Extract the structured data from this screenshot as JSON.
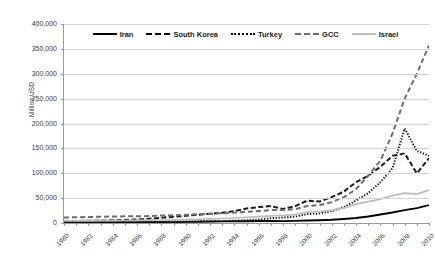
{
  "chart_data": {
    "type": "line",
    "title": "",
    "xlabel": "",
    "ylabel": "Million USD",
    "ylim": [
      0,
      400000
    ],
    "ytick_labels": [
      "400,000",
      "350,000",
      "300,000",
      "250,000",
      "200,000",
      "150,000",
      "100,000",
      "50,000",
      "0"
    ],
    "ytick_values": [
      400000,
      350000,
      300000,
      250000,
      200000,
      150000,
      100000,
      50000,
      0
    ],
    "grid": true,
    "legend_position": "top-inside",
    "x": [
      1980,
      1981,
      1982,
      1983,
      1984,
      1985,
      1986,
      1987,
      1988,
      1989,
      1990,
      1991,
      1992,
      1993,
      1994,
      1995,
      1996,
      1997,
      1998,
      1999,
      2000,
      2001,
      2002,
      2003,
      2004,
      2005,
      2006,
      2007,
      2008,
      2009,
      2010
    ],
    "xtick_labels": [
      "1980",
      "1982",
      "1984",
      "1986",
      "1988",
      "1990",
      "1992",
      "1994",
      "1996",
      "1998",
      "2000",
      "2002",
      "2004",
      "2006",
      "2008",
      "2010"
    ],
    "xlim": [
      1980,
      2010
    ],
    "series": [
      {
        "name": "Iran",
        "style": "solid",
        "color": "#000000",
        "values": [
          1800,
          1500,
          1400,
          1600,
          1500,
          1600,
          1400,
          1500,
          1600,
          1800,
          2200,
          2600,
          3000,
          3200,
          3400,
          3600,
          4000,
          4200,
          3800,
          4200,
          5000,
          5600,
          6500,
          8000,
          10000,
          13000,
          17000,
          21000,
          26000,
          30000,
          36000
        ]
      },
      {
        "name": "South Korea",
        "style": "dashed",
        "color": "#1a1a1a",
        "values": [
          3500,
          4000,
          4500,
          5000,
          5500,
          6000,
          7000,
          8500,
          10500,
          12500,
          14500,
          16500,
          18500,
          20500,
          24000,
          29000,
          32000,
          34000,
          28000,
          34000,
          45000,
          43000,
          52000,
          63000,
          82000,
          95000,
          113000,
          135000,
          140000,
          100000,
          130000
        ]
      },
      {
        "name": "Turkey",
        "style": "dotted",
        "color": "#151515",
        "values": [
          2000,
          2000,
          2100,
          2200,
          2300,
          2400,
          2500,
          2600,
          2700,
          2900,
          3100,
          3300,
          3600,
          4000,
          4500,
          5500,
          7000,
          9500,
          11000,
          13000,
          18000,
          19000,
          24000,
          32000,
          45000,
          60000,
          82000,
          110000,
          190000,
          145000,
          135000
        ]
      },
      {
        "name": "GCC",
        "style": "longdash",
        "color": "#6e6e6e",
        "values": [
          11000,
          11500,
          12000,
          12500,
          13000,
          13500,
          13500,
          14000,
          15000,
          15500,
          16500,
          17500,
          18500,
          19500,
          21000,
          22500,
          24000,
          26000,
          26000,
          28000,
          34000,
          36000,
          42000,
          52000,
          68000,
          95000,
          125000,
          180000,
          250000,
          300000,
          357000
        ]
      },
      {
        "name": "Israel",
        "style": "solid-gray",
        "color": "#bdbdbd",
        "values": [
          4000,
          4200,
          4400,
          4600,
          4800,
          5000,
          5200,
          5600,
          6000,
          6500,
          7000,
          7500,
          8200,
          9000,
          10000,
          11500,
          13000,
          14500,
          15500,
          17000,
          22000,
          23000,
          26000,
          30000,
          38000,
          43000,
          48000,
          55000,
          60000,
          58000,
          66000
        ]
      }
    ],
    "legend": [
      {
        "label": "Iran",
        "style": "solid",
        "color": "#000000"
      },
      {
        "label": "South Korea",
        "style": "dashed",
        "color": "#1a1a1a"
      },
      {
        "label": "Turkey",
        "style": "dotted",
        "color": "#151515"
      },
      {
        "label": "GCC",
        "style": "longdash",
        "color": "#6e6e6e"
      },
      {
        "label": "Israel",
        "style": "solid-gray",
        "color": "#bdbdbd"
      }
    ]
  }
}
